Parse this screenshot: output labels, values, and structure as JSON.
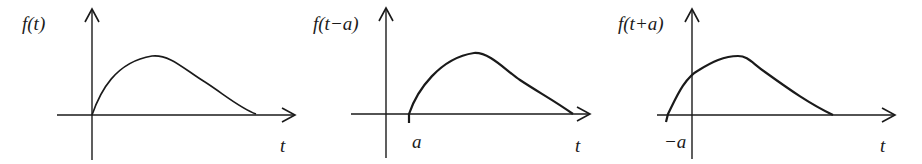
{
  "diagram": {
    "stroke_color": "#1a1a1a",
    "background": "#ffffff",
    "panels": [
      {
        "id": "original",
        "ylabel": "f(t)",
        "xlabel": "t",
        "marker_label": "",
        "axis": {
          "origin_x": 92,
          "axis_y": 115,
          "y_top": 9,
          "y_bottom": 160,
          "x_left": 57,
          "x_right": 295
        },
        "curve": "M92,115 C100,92 115,62 152,56 C170,54 185,70 205,82 C225,95 240,108 256,114",
        "label_pos": {
          "ylabel": [
            22,
            14
          ],
          "xlabel": [
            280,
            136
          ],
          "marker": null
        }
      },
      {
        "id": "shift-right",
        "ylabel": "f(t−a)",
        "xlabel": "t",
        "marker_label": "a",
        "axis": {
          "origin_x": 386,
          "axis_y": 114,
          "y_top": 8,
          "y_bottom": 158,
          "x_left": 351,
          "x_right": 590
        },
        "curve": "M409,123 L409,114 C417,90 440,58 474,53 C490,52 505,70 520,80 C538,92 555,101 573,114",
        "label_pos": {
          "ylabel": [
            313,
            14
          ],
          "xlabel": [
            575,
            136
          ],
          "marker": [
            412,
            132
          ]
        }
      },
      {
        "id": "shift-left",
        "ylabel": "f(t+a)",
        "xlabel": "t",
        "marker_label": "−a",
        "axis": {
          "origin_x": 692,
          "axis_y": 115,
          "y_top": 9,
          "y_bottom": 159,
          "x_left": 657,
          "x_right": 895
        },
        "curve": "M666,122 L668,114 C676,98 684,78 699,70 C712,62 724,56 738,56 C748,56 752,63 765,72 C790,90 810,104 833,115",
        "label_pos": {
          "ylabel": [
            618,
            14
          ],
          "xlabel": [
            880,
            136
          ],
          "marker": [
            664,
            132
          ]
        }
      }
    ]
  }
}
